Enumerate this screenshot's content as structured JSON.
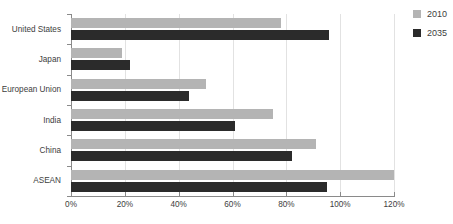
{
  "chart_data": {
    "type": "bar",
    "orientation": "horizontal",
    "title": "",
    "xlabel": "",
    "ylabel": "",
    "categories": [
      "United States",
      "Japan",
      "European Union",
      "India",
      "China",
      "ASEAN"
    ],
    "series": [
      {
        "name": "2010",
        "color": "#b4b4b4",
        "values": [
          78,
          19,
          50,
          75,
          91,
          120
        ]
      },
      {
        "name": "2035",
        "color": "#2b2b2b",
        "values": [
          96,
          22,
          44,
          61,
          82,
          95
        ]
      }
    ],
    "xlim": [
      0,
      120
    ],
    "xticks": [
      0,
      20,
      40,
      60,
      80,
      100,
      120
    ],
    "xticklabels": [
      "0%",
      "20%",
      "40%",
      "60%",
      "80%",
      "100%",
      "120%"
    ],
    "grid": "vertical",
    "legend_position": "right-top",
    "value_suffix": "%"
  },
  "legend": {
    "items": [
      {
        "label": "2010",
        "color": "#b4b4b4"
      },
      {
        "label": "2035",
        "color": "#2b2b2b"
      }
    ]
  },
  "colors": {
    "series_2010": "#b4b4b4",
    "series_2035": "#2b2b2b",
    "gridline": "#e2e2e2",
    "axis": "#8a8a8a",
    "text": "#3d3d3d",
    "background": "#ffffff"
  }
}
